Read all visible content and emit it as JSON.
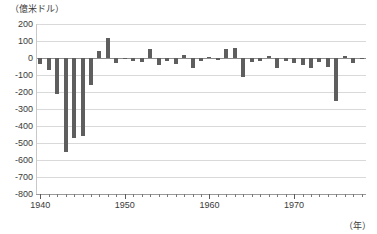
{
  "chart_data": {
    "type": "bar",
    "title": "（億米ドル）",
    "xlabel": "（年）",
    "ylabel": "",
    "unit_note": "（億米ドル）",
    "ylim": [
      -800,
      200
    ],
    "ytick_labels": [
      "200",
      "100",
      "0",
      "-100",
      "-200",
      "-300",
      "-400",
      "-500",
      "-600",
      "-700",
      "-800"
    ],
    "ytick_values": [
      200,
      100,
      0,
      -100,
      -200,
      -300,
      -400,
      -500,
      -600,
      -700,
      -800
    ],
    "xtick_labels": [
      "1940",
      "1950",
      "1960",
      "1970"
    ],
    "xtick_values": [
      1940,
      1950,
      1960,
      1970
    ],
    "xlim": [
      1939.5,
      1978.5
    ],
    "grid": true,
    "legend": "none",
    "bar_color": "#5e5e5e",
    "categories": [
      1940,
      1941,
      1942,
      1943,
      1944,
      1945,
      1946,
      1947,
      1948,
      1949,
      1950,
      1951,
      1952,
      1953,
      1954,
      1955,
      1956,
      1957,
      1958,
      1959,
      1960,
      1961,
      1962,
      1963,
      1964,
      1965,
      1966,
      1967,
      1968,
      1969,
      1970,
      1971,
      1972,
      1973,
      1974,
      1975,
      1976,
      1977,
      1978
    ],
    "values": [
      -35,
      -70,
      -210,
      -550,
      -470,
      -460,
      -160,
      40,
      120,
      -30,
      -5,
      -15,
      -25,
      55,
      -40,
      -15,
      -35,
      20,
      -60,
      -15,
      5,
      -10,
      55,
      60,
      -110,
      -25,
      -20,
      10,
      -60,
      -20,
      -30,
      -40,
      -60,
      -25,
      -50,
      -250,
      10,
      -30,
      -5
    ],
    "values_second_half": [
      -250,
      -55,
      -125,
      -60,
      -530,
      -770,
      -590,
      -370
    ]
  },
  "series_note": {
    "bars": [
      {
        "year": 1940,
        "value": -35
      },
      {
        "year": 1941,
        "value": -70
      },
      {
        "year": 1942,
        "value": -210
      },
      {
        "year": 1943,
        "value": -550
      },
      {
        "year": 1944,
        "value": -470
      },
      {
        "year": 1945,
        "value": -460
      },
      {
        "year": 1946,
        "value": -160
      },
      {
        "year": 1947,
        "value": 40
      },
      {
        "year": 1948,
        "value": 120
      },
      {
        "year": 1949,
        "value": -30
      },
      {
        "year": 1950,
        "value": -5
      },
      {
        "year": 1951,
        "value": -15
      },
      {
        "year": 1952,
        "value": -25
      },
      {
        "year": 1953,
        "value": 55
      },
      {
        "year": 1954,
        "value": -40
      },
      {
        "year": 1955,
        "value": -15
      },
      {
        "year": 1956,
        "value": -35
      },
      {
        "year": 1957,
        "value": 20
      },
      {
        "year": 1958,
        "value": -60
      },
      {
        "year": 1959,
        "value": -15
      },
      {
        "year": 1960,
        "value": 5
      },
      {
        "year": 1961,
        "value": -10
      },
      {
        "year": 1962,
        "value": 55
      },
      {
        "year": 1963,
        "value": 60
      },
      {
        "year": 1964,
        "value": -110
      },
      {
        "year": 1965,
        "value": -25
      },
      {
        "year": 1966,
        "value": -20
      },
      {
        "year": 1967,
        "value": 10
      },
      {
        "year": 1968,
        "value": -60
      },
      {
        "year": 1969,
        "value": -20
      },
      {
        "year": 1970,
        "value": -30
      },
      {
        "year": 1971,
        "value": -40
      },
      {
        "year": 1972,
        "value": -60
      },
      {
        "year": 1973,
        "value": -25
      },
      {
        "year": 1974,
        "value": -50
      },
      {
        "year": 1975,
        "value": -250
      },
      {
        "year": 1976,
        "value": 10
      },
      {
        "year": 1977,
        "value": -30
      },
      {
        "year": 1978,
        "value": -5
      }
    ]
  }
}
